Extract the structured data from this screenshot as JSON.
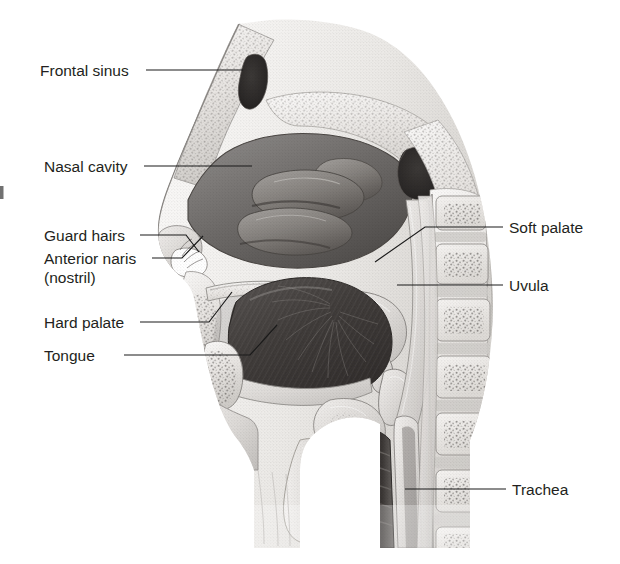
{
  "figure": {
    "background_color": "#ffffff",
    "text_color": "#231f20",
    "leader_color": "#1a1a1a",
    "width": 620,
    "height": 564
  },
  "labels": {
    "frontal_sinus": "Frontal sinus",
    "nasal_cavity": "Nasal cavity",
    "guard_hairs": "Guard hairs",
    "anterior_naris": "Anterior naris",
    "anterior_naris_line2": "(nostril)",
    "hard_palate": "Hard palate",
    "tongue": "Tongue",
    "soft_palate": "Soft palate",
    "uvula": "Uvula",
    "trachea": "Trachea"
  },
  "label_list": [
    {
      "id": "frontal-sinus",
      "text": "Frontal sinus",
      "side": "left",
      "x": 40,
      "y": 76
    },
    {
      "id": "nasal-cavity",
      "text": "Nasal cavity",
      "side": "left",
      "x": 44,
      "y": 172
    },
    {
      "id": "guard-hairs",
      "text": "Guard hairs",
      "side": "left",
      "x": 44,
      "y": 241
    },
    {
      "id": "anterior-naris",
      "text": "Anterior naris",
      "side": "left",
      "x": 44,
      "y": 264
    },
    {
      "id": "anterior-naris-nostril",
      "text": "(nostril)",
      "side": "left",
      "x": 44,
      "y": 283
    },
    {
      "id": "hard-palate",
      "text": "Hard palate",
      "side": "left",
      "x": 44,
      "y": 328
    },
    {
      "id": "tongue",
      "text": "Tongue",
      "side": "left",
      "x": 44,
      "y": 361
    },
    {
      "id": "soft-palate",
      "text": "Soft palate",
      "side": "right",
      "x": 509,
      "y": 233
    },
    {
      "id": "uvula",
      "text": "Uvula",
      "side": "right",
      "x": 509,
      "y": 291
    },
    {
      "id": "trachea",
      "text": "Trachea",
      "side": "right",
      "x": 512,
      "y": 495
    }
  ],
  "illustration": {
    "type": "grayscale-anatomical-halftone",
    "description": "Mid-sagittal section through the human head and neck showing nasal cavity with turbinates, frontal sinus, sphenoid sinus, hard and soft palate, uvula, tongue, oral cavity, pharynx, epiglottis, larynx, trachea, esophagus and cervical vertebrae.",
    "regions": [
      "frontal-sinus",
      "nasal-cavity",
      "turbinates",
      "sphenoid-sinus",
      "hard-palate",
      "soft-palate",
      "uvula",
      "tongue",
      "oral-cavity",
      "pharynx",
      "epiglottis",
      "larynx",
      "trachea",
      "esophagus",
      "cervical-vertebrae",
      "nostril",
      "guard-hairs"
    ]
  }
}
